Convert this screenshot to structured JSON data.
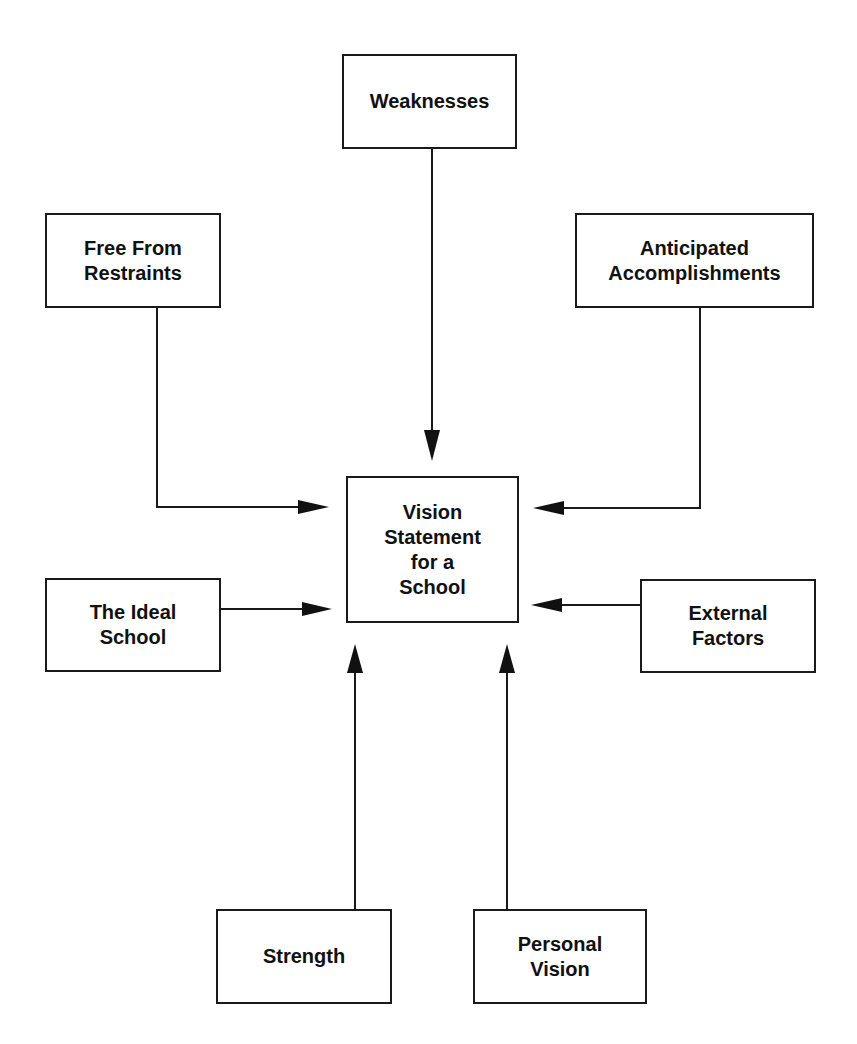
{
  "diagram": {
    "title": "Vision Statement for a School",
    "center": {
      "label": "Vision\nStatement\nfor a\nSchool"
    },
    "nodes": [
      {
        "id": "weaknesses",
        "label": "Weaknesses"
      },
      {
        "id": "free-from-restraints",
        "label": "Free From\nRestraints"
      },
      {
        "id": "anticipated-accomplishments",
        "label": "Anticipated\nAccomplishments"
      },
      {
        "id": "ideal-school",
        "label": "The Ideal\nSchool"
      },
      {
        "id": "external-factors",
        "label": "External\nFactors"
      },
      {
        "id": "strength",
        "label": "Strength"
      },
      {
        "id": "personal-vision",
        "label": "Personal\nVision"
      }
    ],
    "edges": [
      {
        "from": "weaknesses",
        "to": "center"
      },
      {
        "from": "free-from-restraints",
        "to": "center"
      },
      {
        "from": "anticipated-accomplishments",
        "to": "center"
      },
      {
        "from": "ideal-school",
        "to": "center"
      },
      {
        "from": "external-factors",
        "to": "center"
      },
      {
        "from": "strength",
        "to": "center"
      },
      {
        "from": "personal-vision",
        "to": "center"
      }
    ],
    "colors": {
      "stroke": "#1a1a1a",
      "background": "#ffffff"
    }
  }
}
